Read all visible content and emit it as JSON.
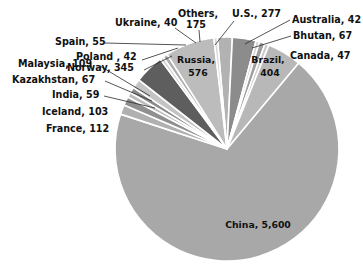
{
  "chart_data": {
    "type": "pie",
    "title": "",
    "subtitle": "",
    "xlabel": "",
    "ylabel": "",
    "legend_position": "none",
    "grid": false,
    "total": 8120,
    "units": "",
    "categories": [
      "Others",
      "U.S.",
      "Australia",
      "Bhutan",
      "Canada",
      "Brazil",
      "China",
      "France",
      "Iceland",
      "India",
      "Kazakhstan",
      "Malaysia",
      "Norway",
      "Poland",
      "Spain",
      "Russia",
      "Ukraine"
    ],
    "values": [
      175,
      277,
      42,
      67,
      47,
      404,
      5600,
      112,
      103,
      59,
      67,
      109,
      345,
      42,
      55,
      576,
      40
    ],
    "slices": [
      {
        "name": "Others",
        "value": 175,
        "label": "Others,",
        "label2": "175",
        "color": "#b2b2b2",
        "label_place": "outer"
      },
      {
        "name": "U.S.",
        "value": 277,
        "label": "U.S., 277",
        "label2": "",
        "color": "#8c8c8c",
        "label_place": "outer"
      },
      {
        "name": "Australia",
        "value": 42,
        "label": "Australia, 42",
        "label2": "",
        "color": "#d4d4d4",
        "label_place": "outer"
      },
      {
        "name": "Bhutan",
        "value": 67,
        "label": "Bhutan, 67",
        "label2": "",
        "color": "#9e9e9e",
        "label_place": "outer"
      },
      {
        "name": "Canada",
        "value": 47,
        "label": "Canada, 47",
        "label2": "",
        "color": "#c9c9c9",
        "label_place": "outer"
      },
      {
        "name": "Brazil",
        "value": 404,
        "label": "Brazil,",
        "label2": "404",
        "color": "#b8b8b8",
        "label_place": "inner"
      },
      {
        "name": "China",
        "value": 5600,
        "label": "China, 5,600",
        "label2": "",
        "color": "#a8a8a8",
        "label_place": "inner"
      },
      {
        "name": "France",
        "value": 112,
        "label": "France, 112",
        "label2": "",
        "color": "#b0b0b0",
        "label_place": "outer"
      },
      {
        "name": "Iceland",
        "value": 103,
        "label": "Iceland, 103",
        "label2": "",
        "color": "#909090",
        "label_place": "outer"
      },
      {
        "name": "India",
        "value": 59,
        "label": "India, 59",
        "label2": "",
        "color": "#bdbdbd",
        "label_place": "outer"
      },
      {
        "name": "Kazakhstan",
        "value": 67,
        "label": "Kazakhstan, 67",
        "label2": "",
        "color": "#8a8a8a",
        "label_place": "outer"
      },
      {
        "name": "Malaysia",
        "value": 109,
        "label": "Malaysia, 109",
        "label2": "",
        "color": "#c4c4c4",
        "label_place": "outer"
      },
      {
        "name": "Norway",
        "value": 345,
        "label": "Norway, 345",
        "label2": "",
        "color": "#5e5e5e",
        "label_place": "outer"
      },
      {
        "name": "Poland",
        "value": 42,
        "label": "Poland , 42",
        "label2": "",
        "color": "#cfcfcf",
        "label_place": "outer"
      },
      {
        "name": "Spain",
        "value": 55,
        "label": "Spain, 55",
        "label2": "",
        "color": "#adadad",
        "label_place": "outer"
      },
      {
        "name": "Russia",
        "value": 576,
        "label": "Russia,",
        "label2": "576",
        "color": "#bcbcbc",
        "label_place": "inner"
      },
      {
        "name": "Ukraine",
        "value": 40,
        "label": "Ukraine, 40",
        "label2": "",
        "color": "#d8d8d8",
        "label_place": "outer"
      }
    ]
  },
  "labels": {
    "others": {
      "line1": "Others,",
      "line2": "175",
      "x": 178,
      "y": 14,
      "x2": 186,
      "y2": 25,
      "anchor": "start",
      "leader": "M 199 30 L 200 42"
    },
    "us": {
      "line1": "U.S., 277",
      "line2": "",
      "x": 232,
      "y": 14,
      "x2": 0,
      "y2": 0,
      "anchor": "start",
      "leader": "M 234 21 L 215 45"
    },
    "australia": {
      "line1": "Australia, 42",
      "line2": "",
      "x": 292,
      "y": 20,
      "x2": 0,
      "y2": 0,
      "anchor": "start",
      "leader": "M 290 20 L 245 44"
    },
    "bhutan": {
      "line1": "Bhutan, 67",
      "line2": "",
      "x": 293,
      "y": 36,
      "x2": 0,
      "y2": 0,
      "anchor": "start",
      "leader": "M 291 36 L 252 48"
    },
    "canada": {
      "line1": "Canada, 47",
      "line2": "",
      "x": 290,
      "y": 56,
      "x2": 0,
      "y2": 0,
      "anchor": "start",
      "leader": ""
    },
    "brazil": {
      "line1": "Brazil,",
      "line2": "404",
      "x": 268,
      "y": 60,
      "x2": 270,
      "y2": 73,
      "anchor": "middle",
      "leader": ""
    },
    "china": {
      "line1": "China, 5,600",
      "line2": "",
      "x": 258,
      "y": 225,
      "x2": 0,
      "y2": 0,
      "anchor": "middle",
      "leader": ""
    },
    "russia": {
      "line1": "Russia,",
      "line2": "576",
      "x": 196,
      "y": 60,
      "x2": 198,
      "y2": 73,
      "anchor": "middle",
      "leader": ""
    },
    "ukraine": {
      "line1": "Ukraine, 40",
      "line2": "",
      "x": 115,
      "y": 23,
      "x2": 0,
      "y2": 0,
      "anchor": "start",
      "leader": "M 175 28 L 196 43"
    },
    "spain": {
      "line1": "Spain, 55",
      "line2": "",
      "x": 55,
      "y": 42,
      "x2": 0,
      "y2": 0,
      "anchor": "start",
      "leader": "M 105 43 L 186 45"
    },
    "poland": {
      "line1": "Poland , 42",
      "line2": "",
      "x": 76,
      "y": 57,
      "x2": 0,
      "y2": 0,
      "anchor": "start",
      "leader": "M 142 60 L 178 48"
    },
    "norway": {
      "line1": "Norway, 345",
      "line2": "",
      "x": 67,
      "y": 68,
      "x2": 0,
      "y2": 0,
      "anchor": "start",
      "leader": "M 144 70 L 172 56"
    },
    "malaysia": {
      "line1": "Malaysia, 109",
      "line2": "",
      "x": 18,
      "y": 64,
      "x2": 0,
      "y2": 0,
      "anchor": "start",
      "leader": "M 100 66 L 150 96"
    },
    "kazakhstan": {
      "line1": "Kazakhstan, 67",
      "line2": "",
      "x": 12,
      "y": 80,
      "x2": 0,
      "y2": 0,
      "anchor": "start",
      "leader": "M 105 81 L 152 101"
    },
    "india": {
      "line1": "India, 59",
      "line2": "",
      "x": 52,
      "y": 95,
      "x2": 0,
      "y2": 0,
      "anchor": "start",
      "leader": "M 104 96 L 155 108"
    },
    "iceland": {
      "line1": "Iceland, 103",
      "line2": "",
      "x": 42,
      "y": 112,
      "x2": 0,
      "y2": 0,
      "anchor": "start",
      "leader": ""
    },
    "france": {
      "line1": "France, 112",
      "line2": "",
      "x": 46,
      "y": 129,
      "x2": 0,
      "y2": 0,
      "anchor": "start",
      "leader": ""
    }
  },
  "geometry": {
    "cx": 227,
    "cy": 149,
    "radius": 112
  }
}
